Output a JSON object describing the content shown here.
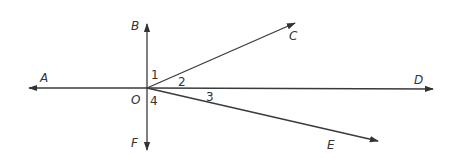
{
  "diagram": {
    "type": "geometry-rays",
    "colors": {
      "stroke": "#3a3a3a",
      "text": "#333333",
      "background": "#ffffff"
    },
    "origin": {
      "label": "O",
      "x": 147,
      "y": 88
    },
    "points": {
      "A": {
        "label": "A",
        "tip": [
          27,
          88
        ]
      },
      "B": {
        "label": "B",
        "tip": [
          147,
          22
        ]
      },
      "C": {
        "label": "C",
        "tip": [
          297,
          22
        ]
      },
      "D": {
        "label": "D",
        "tip": [
          435,
          89
        ]
      },
      "E": {
        "label": "E",
        "tip": [
          380,
          142
        ]
      },
      "F": {
        "label": "F",
        "tip": [
          147,
          152
        ]
      }
    },
    "angles": [
      {
        "label": "1",
        "between": [
          "OB",
          "OC"
        ]
      },
      {
        "label": "2",
        "between": [
          "OC",
          "OD"
        ]
      },
      {
        "label": "3",
        "between": [
          "OD",
          "OE"
        ]
      },
      {
        "label": "4",
        "between": [
          "OE",
          "OF"
        ]
      }
    ]
  }
}
